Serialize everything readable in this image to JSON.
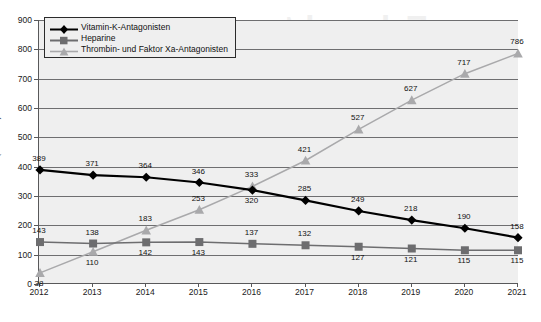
{
  "chart_data": {
    "type": "line",
    "title": "",
    "xlabel": "",
    "ylabel": "(Mio. DDD)",
    "categories": [
      "2012",
      "2013",
      "2014",
      "2015",
      "2016",
      "2017",
      "2018",
      "2019",
      "2020",
      "2021"
    ],
    "ylim": [
      0,
      900
    ],
    "yticks": [
      0,
      100,
      200,
      300,
      400,
      500,
      600,
      700,
      800,
      900
    ],
    "grid": "horizontal",
    "legend_position": "top-left",
    "series": [
      {
        "name": "Vitamin-K-Antagonisten",
        "color": "#000000",
        "marker": "diamond",
        "values": [
          389,
          371,
          364,
          346,
          320,
          285,
          249,
          218,
          190,
          158
        ],
        "label_positions": [
          "above",
          "above",
          "above",
          "above",
          "below",
          "above",
          "above",
          "above",
          "above",
          "above"
        ]
      },
      {
        "name": "Heparine",
        "color": "#6d6d6f",
        "marker": "square",
        "values": [
          143,
          138,
          142,
          143,
          137,
          132,
          127,
          121,
          115,
          115
        ],
        "label_positions": [
          "above",
          "above",
          "below",
          "below",
          "above",
          "above",
          "below",
          "below",
          "below",
          "below"
        ]
      },
      {
        "name": "Thrombin- und Faktor Xa-Antagonisten",
        "color": "#a9a9ab",
        "marker": "triangle",
        "values": [
          38,
          110,
          183,
          253,
          333,
          421,
          527,
          627,
          717,
          786
        ],
        "label_positions": [
          "below",
          "below",
          "above",
          "above",
          "above",
          "above",
          "above",
          "above",
          "above",
          "above"
        ]
      }
    ]
  },
  "legend": {
    "items": [
      {
        "label": "Vitamin-K-Antagonisten"
      },
      {
        "label": "Heparine"
      },
      {
        "label": "Thrombin- und Faktor Xa-Antagonisten"
      }
    ]
  },
  "watermark": {
    "line1": "Erkrankt zu",
    "line2": "rzneiverordnungs",
    "line3": "2",
    "line4": "in Deutsch"
  }
}
